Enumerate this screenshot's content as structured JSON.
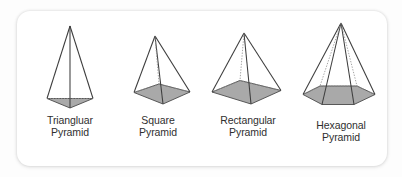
{
  "figure": {
    "background_color": "#fdfdfd",
    "panel_color": "#ffffff",
    "edge_color": "#4a4a4a",
    "base_fill_color": "#a9a9a9",
    "hidden_edge_style": "dotted",
    "items": [
      {
        "id": "triangular-pyramid",
        "label_line1": "Triangluar",
        "label_line2": "Pyramid",
        "base_shape": "triangle",
        "base_sides": 3
      },
      {
        "id": "square-pyramid",
        "label_line1": "Square",
        "label_line2": "Pyramid",
        "base_shape": "square",
        "base_sides": 4
      },
      {
        "id": "rectangular-pyramid",
        "label_line1": "Rectangular",
        "label_line2": "Pyramid",
        "base_shape": "rectangle",
        "base_sides": 4
      },
      {
        "id": "hexagonal-pyramid",
        "label_line1": "Hexagonal",
        "label_line2": "Pyramid",
        "base_shape": "hexagon",
        "base_sides": 6
      }
    ]
  }
}
